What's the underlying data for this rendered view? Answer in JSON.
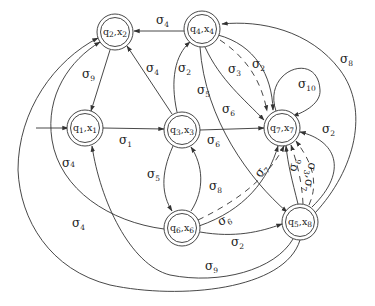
{
  "diagram": {
    "type": "state-transition-graph",
    "colors": {
      "stroke": "#333333",
      "background": "#ffffff",
      "text": "#222222"
    },
    "nodes": [
      {
        "id": "n2",
        "label": "q2,x2",
        "q": "q",
        "qs": "2",
        "x": "x",
        "xs": "2"
      },
      {
        "id": "n4",
        "label": "q4,x4",
        "q": "q",
        "qs": "4",
        "x": "x",
        "xs": "4"
      },
      {
        "id": "n1",
        "label": "q1,x1",
        "q": "q",
        "qs": "1",
        "x": "x",
        "xs": "1",
        "initial": true
      },
      {
        "id": "n3",
        "label": "q3,x3",
        "q": "q",
        "qs": "3",
        "x": "x",
        "xs": "3"
      },
      {
        "id": "n7",
        "label": "q7,x7",
        "q": "q",
        "qs": "7",
        "x": "x",
        "xs": "7"
      },
      {
        "id": "n6",
        "label": "q6,x6",
        "q": "q",
        "qs": "6",
        "x": "x",
        "xs": "6"
      },
      {
        "id": "n5",
        "label": "q5,x8",
        "q": "q",
        "qs": "5",
        "x": "x",
        "xs": "8"
      }
    ],
    "edges": [
      {
        "from": "n4",
        "to": "n2",
        "label": "σ4",
        "sym": "σ",
        "sub": "4"
      },
      {
        "from": "n2",
        "to": "n1",
        "label": "σ9",
        "sym": "σ",
        "sub": "9"
      },
      {
        "from": "n3",
        "to": "n2",
        "label": "σ4",
        "sym": "σ",
        "sub": "4"
      },
      {
        "from": "n1",
        "to": "n3",
        "label": "σ1",
        "sym": "σ",
        "sub": "1"
      },
      {
        "from": "n3",
        "to": "n4",
        "label": "σ2",
        "sym": "σ",
        "sub": "2"
      },
      {
        "from": "n4",
        "to": "n7",
        "label": "σ3",
        "sym": "σ",
        "sub": "3",
        "dashed": true
      },
      {
        "from": "n4",
        "to": "n7",
        "label": "σ2",
        "sym": "σ",
        "sub": "2"
      },
      {
        "from": "n4",
        "to": "n7",
        "label": "σ6",
        "sym": "σ",
        "sub": "6"
      },
      {
        "from": "n4",
        "to": "n5",
        "label": "σ5",
        "sym": "σ",
        "sub": "5"
      },
      {
        "from": "n7",
        "to": "n7",
        "label": "σ10",
        "sym": "σ",
        "sub": "10"
      },
      {
        "from": "n5",
        "to": "n4",
        "label": "σ8",
        "sym": "σ",
        "sub": "8"
      },
      {
        "from": "n3",
        "to": "n7",
        "label": "σ6",
        "sym": "σ",
        "sub": "6"
      },
      {
        "from": "n5",
        "to": "n7",
        "label": "σ2",
        "sym": "σ",
        "sub": "2"
      },
      {
        "from": "n5",
        "to": "n7",
        "label": "σ3,σ7",
        "sym": "σ",
        "sub": "3",
        "sym2": "σ",
        "sub2": "7",
        "dashed": true
      },
      {
        "from": "n5",
        "to": "n7",
        "label": "σ6",
        "sym": "σ",
        "sub": "6",
        "dashed": true
      },
      {
        "from": "n6",
        "to": "n7",
        "label": "σ7",
        "sym": "σ",
        "sub": "7",
        "dashed": true
      },
      {
        "from": "n6",
        "to": "n7",
        "label": "σ6",
        "sym": "σ",
        "sub": "6"
      },
      {
        "from": "n3",
        "to": "n6",
        "label": "σ5",
        "sym": "σ",
        "sub": "5"
      },
      {
        "from": "n6",
        "to": "n3",
        "label": "σ8",
        "sym": "σ",
        "sub": "8"
      },
      {
        "from": "n6",
        "to": "n5",
        "label": "σ2",
        "sym": "σ",
        "sub": "2"
      },
      {
        "from": "n6",
        "to": "n2",
        "label": "σ4",
        "sym": "σ",
        "sub": "4"
      },
      {
        "from": "n5",
        "to": "n1",
        "label": "σ9",
        "sym": "σ",
        "sub": "9"
      },
      {
        "from": "n5",
        "to": "n2",
        "label": "σ4",
        "sym": "σ",
        "sub": "4"
      },
      {
        "from": "n4",
        "to": "n5",
        "label": "σ5",
        "sym": "σ",
        "sub": "5"
      }
    ]
  }
}
